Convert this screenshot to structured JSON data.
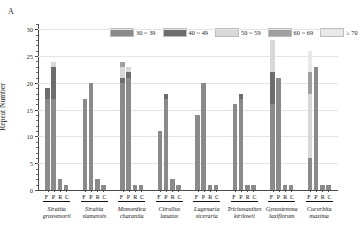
{
  "figure": {
    "panel_label": "A"
  },
  "chart_data": {
    "type": "bar",
    "stacked": true,
    "title": "",
    "xlabel": "",
    "ylabel": "Repeat Number",
    "ylim": [
      0,
      31
    ],
    "yticks": [
      0,
      5,
      10,
      15,
      20,
      25,
      30
    ],
    "ytick_labels": [
      "0",
      "5",
      "10",
      "15",
      "20",
      "25",
      "30"
    ],
    "grid": true,
    "legend_position": "top-center",
    "legend": [
      {
        "label": "30 ~ 39",
        "color": "#8a8a8a"
      },
      {
        "label": "40 ~ 49",
        "color": "#6d6d6d"
      },
      {
        "label": "50 ~ 59",
        "color": "#d8d8d8"
      },
      {
        "label": "60 ~ 69",
        "color": "#a0a0a0"
      },
      {
        "label": "≥ 70",
        "color": "#e8e8e8"
      }
    ],
    "series": [
      {
        "name": "30 ~ 39",
        "color": "#8a8a8a"
      },
      {
        "name": "40 ~ 49",
        "color": "#6d6d6d"
      },
      {
        "name": "50 ~ 59",
        "color": "#d8d8d8"
      },
      {
        "name": "60 ~ 69",
        "color": "#a0a0a0"
      },
      {
        "name": "≥ 70",
        "color": "#e8e8e8"
      }
    ],
    "sub_categories": [
      "F",
      "P",
      "R",
      "C"
    ],
    "groups": [
      {
        "genus": "Siraitia",
        "species": "grosvenorii",
        "bars": [
          {
            "label": "F",
            "total": 19,
            "values": [
              17,
              2,
              0,
              0,
              0
            ]
          },
          {
            "label": "P",
            "total": 24,
            "values": [
              17,
              6,
              1,
              0,
              0
            ]
          },
          {
            "label": "R",
            "total": 2,
            "values": [
              2,
              0,
              0,
              0,
              0
            ]
          },
          {
            "label": "C",
            "total": 1,
            "values": [
              1,
              0,
              0,
              0,
              0
            ]
          }
        ]
      },
      {
        "genus": "Siraitia",
        "species": "siamensis",
        "bars": [
          {
            "label": "F",
            "total": 17,
            "values": [
              17,
              0,
              0,
              0,
              0
            ]
          },
          {
            "label": "P",
            "total": 20,
            "values": [
              20,
              0,
              0,
              0,
              0
            ]
          },
          {
            "label": "R",
            "total": 2,
            "values": [
              2,
              0,
              0,
              0,
              0
            ]
          },
          {
            "label": "C",
            "total": 1,
            "values": [
              1,
              0,
              0,
              0,
              0
            ]
          }
        ]
      },
      {
        "genus": "Momordica",
        "species": "charantia",
        "bars": [
          {
            "label": "F",
            "total": 24,
            "values": [
              20,
              1,
              2,
              1,
              0
            ]
          },
          {
            "label": "P",
            "total": 23,
            "values": [
              21,
              1,
              1,
              0,
              0
            ]
          },
          {
            "label": "R",
            "total": 1,
            "values": [
              1,
              0,
              0,
              0,
              0
            ]
          },
          {
            "label": "C",
            "total": 1,
            "values": [
              1,
              0,
              0,
              0,
              0
            ]
          }
        ]
      },
      {
        "genus": "Citrullus",
        "species": "lanatus",
        "bars": [
          {
            "label": "F",
            "total": 11,
            "values": [
              11,
              0,
              0,
              0,
              0
            ]
          },
          {
            "label": "P",
            "total": 18,
            "values": [
              17,
              1,
              0,
              0,
              0
            ]
          },
          {
            "label": "R",
            "total": 2,
            "values": [
              2,
              0,
              0,
              0,
              0
            ]
          },
          {
            "label": "C",
            "total": 1,
            "values": [
              1,
              0,
              0,
              0,
              0
            ]
          }
        ]
      },
      {
        "genus": "Lagenaria",
        "species": "siceraria",
        "bars": [
          {
            "label": "F",
            "total": 14,
            "values": [
              14,
              0,
              0,
              0,
              0
            ]
          },
          {
            "label": "P",
            "total": 20,
            "values": [
              20,
              0,
              0,
              0,
              0
            ]
          },
          {
            "label": "R",
            "total": 1,
            "values": [
              1,
              0,
              0,
              0,
              0
            ]
          },
          {
            "label": "C",
            "total": 1,
            "values": [
              1,
              0,
              0,
              0,
              0
            ]
          }
        ]
      },
      {
        "genus": "Trichosanthes",
        "species": "kirilowii",
        "bars": [
          {
            "label": "F",
            "total": 16,
            "values": [
              16,
              0,
              0,
              0,
              0
            ]
          },
          {
            "label": "P",
            "total": 18,
            "values": [
              17,
              1,
              0,
              0,
              0
            ]
          },
          {
            "label": "R",
            "total": 1,
            "values": [
              1,
              0,
              0,
              0,
              0
            ]
          },
          {
            "label": "C",
            "total": 1,
            "values": [
              1,
              0,
              0,
              0,
              0
            ]
          }
        ]
      },
      {
        "genus": "Gynostemma",
        "species": "laxiflorum",
        "bars": [
          {
            "label": "F",
            "total": 28,
            "values": [
              16,
              6,
              6,
              0,
              0
            ]
          },
          {
            "label": "P",
            "total": 21,
            "values": [
              21,
              0,
              0,
              0,
              0
            ]
          },
          {
            "label": "R",
            "total": 1,
            "values": [
              1,
              0,
              0,
              0,
              0
            ]
          },
          {
            "label": "C",
            "total": 1,
            "values": [
              1,
              0,
              0,
              0,
              0
            ]
          }
        ]
      },
      {
        "genus": "Cucurbita",
        "species": "maxima",
        "bars": [
          {
            "label": "F",
            "total": 26,
            "values": [
              6,
              0,
              12,
              4,
              4
            ]
          },
          {
            "label": "P",
            "total": 23,
            "values": [
              23,
              0,
              0,
              0,
              0
            ]
          },
          {
            "label": "R",
            "total": 1,
            "values": [
              1,
              0,
              0,
              0,
              0
            ]
          },
          {
            "label": "C",
            "total": 1,
            "values": [
              1,
              0,
              0,
              0,
              0
            ]
          }
        ]
      }
    ]
  }
}
